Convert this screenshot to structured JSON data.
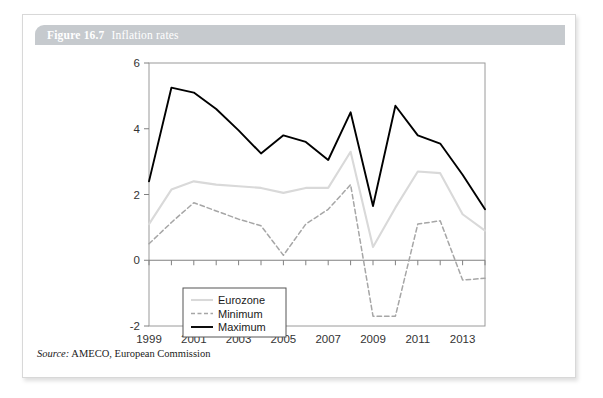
{
  "figure": {
    "number": "Figure 16.7",
    "title": "Inflation rates",
    "source_label": "Source:",
    "source_text": "AMECO, European Commission"
  },
  "colors": {
    "title_bar": "#c6cace",
    "title_text": "#ffffff",
    "card_bg": "#ffffff",
    "card_border": "#d8d8d8",
    "axis": "#808080",
    "maximum": "#000000",
    "eurozone": "#d9d9d9",
    "minimum": "#a6a6a6",
    "tick_text": "#333333"
  },
  "chart_data": {
    "type": "line",
    "title": "Inflation rates",
    "xlabel": "",
    "ylabel": "",
    "x": [
      1999,
      2000,
      2001,
      2002,
      2003,
      2004,
      2005,
      2006,
      2007,
      2008,
      2009,
      2010,
      2011,
      2012,
      2013,
      2014
    ],
    "xlim": [
      1999,
      2014
    ],
    "ylim": [
      -2,
      6
    ],
    "yticks": [
      -2,
      0,
      2,
      4,
      6
    ],
    "xticks": [
      1999,
      2001,
      2003,
      2005,
      2007,
      2009,
      2011,
      2013
    ],
    "xtick_labels": [
      "1999",
      "2001",
      "2003",
      "2005",
      "2007",
      "2009",
      "2011",
      "2013"
    ],
    "ytick_labels": [
      "-2",
      "0",
      "2",
      "4",
      "6"
    ],
    "grid": false,
    "legend_position": "bottom-left",
    "series": [
      {
        "name": "Eurozone",
        "style": "solid",
        "color": "#d9d9d9",
        "values": [
          1.1,
          2.15,
          2.4,
          2.3,
          2.25,
          2.2,
          2.05,
          2.2,
          2.2,
          3.3,
          0.4,
          1.6,
          2.7,
          2.65,
          1.4,
          0.9
        ]
      },
      {
        "name": "Minimum",
        "style": "dashed",
        "color": "#a6a6a6",
        "values": [
          0.5,
          1.15,
          1.75,
          1.5,
          1.25,
          1.05,
          0.15,
          1.1,
          1.55,
          2.3,
          -1.7,
          -1.7,
          1.1,
          1.2,
          -0.6,
          -0.55
        ]
      },
      {
        "name": "Maximum",
        "style": "solid",
        "color": "#000000",
        "values": [
          2.4,
          5.25,
          5.1,
          4.6,
          3.95,
          3.25,
          3.8,
          3.6,
          3.05,
          4.5,
          1.65,
          4.7,
          3.8,
          3.55,
          2.6,
          1.55
        ]
      }
    ]
  },
  "legend": {
    "items": [
      {
        "label": "Eurozone"
      },
      {
        "label": "Minimum"
      },
      {
        "label": "Maximum"
      }
    ]
  }
}
